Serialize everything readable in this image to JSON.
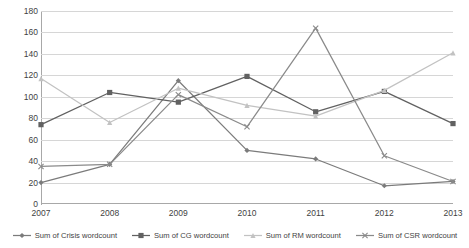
{
  "chart_data": {
    "type": "line",
    "title": "",
    "xlabel": "",
    "ylabel": "",
    "categories": [
      "2007",
      "2008",
      "2009",
      "2010",
      "2011",
      "2012",
      "2013"
    ],
    "ylim": [
      0,
      180
    ],
    "yticks": [
      0,
      20,
      40,
      60,
      80,
      100,
      120,
      140,
      160,
      180
    ],
    "grid": true,
    "legend_position": "bottom",
    "series": [
      {
        "name": "Sum of Crisis wordcount",
        "color": "#7b7b7b",
        "marker": "diamond",
        "values": [
          20,
          37,
          115,
          50,
          42,
          17,
          21
        ]
      },
      {
        "name": "Sum of CG wordcount",
        "color": "#616161",
        "marker": "square",
        "values": [
          74,
          104,
          95,
          119,
          86,
          105,
          75
        ]
      },
      {
        "name": "Sum of RM wordcount",
        "color": "#c2c2c2",
        "marker": "triangle",
        "values": [
          117,
          76,
          108,
          92,
          82,
          106,
          141
        ]
      },
      {
        "name": "Sum of CSR wordcount",
        "color": "#8a8a8a",
        "marker": "cross",
        "values": [
          35,
          37,
          102,
          72,
          164,
          45,
          21
        ]
      }
    ]
  },
  "legend": {
    "items": [
      {
        "label": "Sum of Crisis wordcount"
      },
      {
        "label": "Sum of CG wordcount"
      },
      {
        "label": "Sum of RM wordcount"
      },
      {
        "label": "Sum of CSR wordcount"
      }
    ]
  }
}
